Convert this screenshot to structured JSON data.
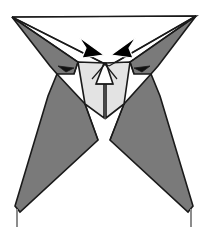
{
  "figure": {
    "kind": "origami-folding-diagram",
    "canvas": {
      "width": 218,
      "height": 231
    },
    "palette": {
      "background": "#ffffff",
      "paper_front_white": "#ffffff",
      "paper_light_gray": "#e3e3e3",
      "paper_mid_gray": "#808080",
      "paper_dark_gray": "#6e6e6e",
      "outline": "#1a1a1a",
      "tail_line": "#8c8c8c",
      "arrow_fill": "#000000",
      "arrow_outline": "#ffffff"
    },
    "shapes": [
      {
        "name": "left-upper-wing-dark",
        "role": "dark-gray-upper-wing",
        "fill": "#7a7a7a",
        "points": "12,17 78,62 74,74 57,74 50,66"
      },
      {
        "name": "right-upper-wing-dark",
        "role": "dark-gray-upper-wing",
        "fill": "#7a7a7a",
        "points": "196,16 130,62 134,74 151,74 158,66"
      },
      {
        "name": "left-upper-white-triangle",
        "role": "white-paper-triangle",
        "fill": "#ffffff",
        "points": "12,17 196,16 109,66"
      },
      {
        "name": "left-center-light-flap",
        "role": "light-gray-flap",
        "fill": "#e3e3e3",
        "points": "78,62 104,63 104,118 85,104"
      },
      {
        "name": "right-center-light-flap",
        "role": "light-gray-flap",
        "fill": "#e3e3e3",
        "points": "130,62 106,63 106,118 124,104"
      },
      {
        "name": "center-white-wedge",
        "role": "white-center-wedge",
        "fill": "#ffffff",
        "points": "104,63 106,63 113,84 96,84"
      },
      {
        "name": "left-leg-dark",
        "role": "dark-gray-leg",
        "fill": "#7a7a7a",
        "points": "57,74 85,104 98,140 20,212 15,206 48,96"
      },
      {
        "name": "right-leg-dark",
        "role": "dark-gray-leg",
        "fill": "#7a7a7a",
        "points": "151,74 124,104 110,140 188,212 193,206 160,96"
      }
    ],
    "lines": [
      {
        "name": "top-edge",
        "role": "paper-top-edge",
        "path": "M12,17 L196,16"
      },
      {
        "name": "left-fold-to-center",
        "role": "fold-line",
        "path": "M12,17 L109,66"
      },
      {
        "name": "right-fold-to-center",
        "role": "fold-line",
        "path": "M196,16 L109,66"
      },
      {
        "name": "left-wing-lower-edge",
        "role": "edge",
        "path": "M12,17 L78,62 L74,74"
      },
      {
        "name": "right-wing-lower-edge",
        "role": "edge",
        "path": "M196,16 L130,62 L134,74"
      },
      {
        "name": "center-crossing-left",
        "role": "crease",
        "path": "M104,63 L117,79"
      },
      {
        "name": "center-crossing-right",
        "role": "crease",
        "path": "M106,63 L92,79"
      },
      {
        "name": "center-wedge-base",
        "role": "crease",
        "path": "M96,84 L113,84"
      },
      {
        "name": "left-leg-inner-crease",
        "role": "crease",
        "path": "M85,104 L98,140"
      },
      {
        "name": "right-leg-inner-crease",
        "role": "crease",
        "path": "M124,104 L110,140"
      }
    ],
    "tails": [
      {
        "name": "left-bottom-tail",
        "role": "point-tail",
        "path": "M17,209 L17,227"
      },
      {
        "name": "right-bottom-tail",
        "role": "point-tail",
        "path": "M191,209 L191,227"
      }
    ],
    "arrows": {
      "large": [
        {
          "name": "left-fold-arrowhead",
          "role": "fold-direction-arrow",
          "direction": "right-down",
          "points": "79,37 104,55 82,58 86,48"
        },
        {
          "name": "right-fold-arrowhead",
          "role": "fold-direction-arrow",
          "direction": "left-down",
          "points": "136,37 111,55 133,58 129,48"
        }
      ],
      "small": [
        {
          "name": "left-tuck-arrow",
          "role": "tuck-direction-arrow",
          "direction": "right",
          "points": "58,66 74,68 66,72"
        },
        {
          "name": "right-tuck-arrow",
          "role": "tuck-direction-arrow",
          "direction": "left",
          "points": "150,66 134,68 142,72"
        }
      ]
    }
  }
}
